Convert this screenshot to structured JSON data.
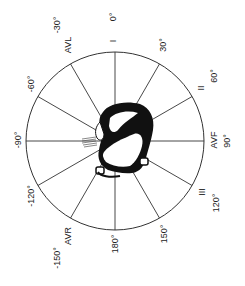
{
  "diagram": {
    "center": [
      115,
      141
    ],
    "radius": 89,
    "line_color": "#333333",
    "axes": [
      {
        "screen_angle_deg": -90,
        "degree_label": "0°",
        "lead_label": "I"
      },
      {
        "screen_angle_deg": -60,
        "degree_label": "30°",
        "lead_label": ""
      },
      {
        "screen_angle_deg": -30,
        "degree_label": "60°",
        "lead_label": "II"
      },
      {
        "screen_angle_deg": 0,
        "degree_label": "90°",
        "lead_label": "AVF"
      },
      {
        "screen_angle_deg": 30,
        "degree_label": "120°",
        "lead_label": "III"
      },
      {
        "screen_angle_deg": 60,
        "degree_label": "150°",
        "lead_label": ""
      },
      {
        "screen_angle_deg": 90,
        "degree_label": "180°",
        "lead_label": ""
      },
      {
        "screen_angle_deg": 120,
        "degree_label": "-150°",
        "lead_label": "AVR"
      },
      {
        "screen_angle_deg": 150,
        "degree_label": "-120°",
        "lead_label": ""
      },
      {
        "screen_angle_deg": 180,
        "degree_label": "-90°",
        "lead_label": ""
      },
      {
        "screen_angle_deg": 210,
        "degree_label": "-60°",
        "lead_label": ""
      },
      {
        "screen_angle_deg": 240,
        "degree_label": "-30°",
        "lead_label": "AVL"
      }
    ],
    "labels": {
      "deg_0": "0°",
      "deg_30": "30°",
      "deg_60": "60°",
      "deg_90": "90°",
      "deg_120": "120°",
      "deg_150": "150°",
      "deg_180": "180°",
      "deg_neg150": "-150°",
      "deg_neg120": "-120°",
      "deg_neg90": "-90°",
      "deg_neg60": "-60°",
      "deg_neg30": "-30°",
      "lead_I": "I",
      "lead_II": "II",
      "lead_III": "III",
      "lead_AVF": "AVF",
      "lead_AVR": "AVR",
      "lead_AVL": "AVL"
    },
    "center_image": "heart-illustration"
  }
}
